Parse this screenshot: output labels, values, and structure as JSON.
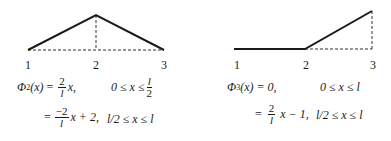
{
  "diagrams": [
    {
      "id": "phi2",
      "nodes": [
        "1",
        "2",
        "3"
      ],
      "shape": "hat",
      "points": [
        [
          28,
          50
        ],
        [
          96,
          15
        ],
        [
          164,
          50
        ]
      ],
      "equation": {
        "name": "Φ",
        "subscript": "2",
        "arg": "(x)",
        "line1": {
          "eq": "=",
          "num": "2",
          "den": "l",
          "rest": "x,",
          "cond_pre": "0 ≤ x ≤",
          "cond_num": "l",
          "cond_den": "2"
        },
        "line2": {
          "eq": "=",
          "num": "−2",
          "den": "l",
          "rest": "x + 2,",
          "cond": "l/2 ≤ x ≤ l"
        }
      }
    },
    {
      "id": "phi3",
      "nodes": [
        "1",
        "2",
        "3"
      ],
      "shape": "ramp",
      "points": [
        [
          234,
          49
        ],
        [
          305,
          49
        ],
        [
          372,
          11
        ]
      ],
      "equation": {
        "name": "Φ",
        "subscript": "3",
        "arg": "(x) = 0,",
        "line1": {
          "cond": "0 ≤ x ≤ l"
        },
        "line2": {
          "eq": "=",
          "num": "2",
          "den": "l",
          "rest": "x − 1,",
          "cond": "l/2 ≤ x ≤ l"
        }
      }
    }
  ],
  "colors": {
    "line": "#1a1a1a",
    "dashed": "#333333",
    "background": "#ffffff"
  }
}
